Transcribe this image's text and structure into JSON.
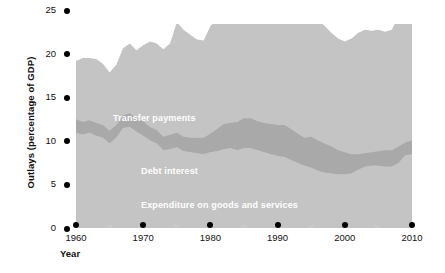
{
  "chart_data": {
    "type": "area",
    "title": "",
    "xlabel": "Year",
    "ylabel": "Outlays (percentage of GDP)",
    "xlim": [
      1960,
      2010
    ],
    "ylim": [
      0,
      25
    ],
    "grid": false,
    "legend_position": "in-plot",
    "stacked": true,
    "x": [
      1960,
      1961,
      1962,
      1963,
      1964,
      1965,
      1966,
      1967,
      1968,
      1969,
      1970,
      1971,
      1972,
      1973,
      1974,
      1975,
      1976,
      1977,
      1978,
      1979,
      1980,
      1981,
      1982,
      1983,
      1984,
      1985,
      1986,
      1987,
      1988,
      1989,
      1990,
      1991,
      1992,
      1993,
      1994,
      1995,
      1996,
      1997,
      1998,
      1999,
      2000,
      2001,
      2002,
      2003,
      2004,
      2005,
      2006,
      2007,
      2008,
      2009,
      2010
    ],
    "series": [
      {
        "name": "Expenditure on goods and services",
        "color": "#c4c4c4",
        "values": [
          9.8,
          9.6,
          9.8,
          9.5,
          9.3,
          8.7,
          9.3,
          10.3,
          10.4,
          9.9,
          9.5,
          9.0,
          8.7,
          8.0,
          8.1,
          8.3,
          7.9,
          7.8,
          7.7,
          7.6,
          7.8,
          7.9,
          8.1,
          8.2,
          8.0,
          8.2,
          8.2,
          8.0,
          7.8,
          7.6,
          7.4,
          7.3,
          7.0,
          6.7,
          6.4,
          6.2,
          5.9,
          5.7,
          5.6,
          5.5,
          5.5,
          5.6,
          6.0,
          6.3,
          6.4,
          6.4,
          6.3,
          6.3,
          6.7,
          7.5,
          7.6
        ]
      },
      {
        "name": "Debt interest",
        "color": "#a9a9a9",
        "values": [
          1.4,
          1.3,
          1.3,
          1.3,
          1.3,
          1.3,
          1.3,
          1.3,
          1.4,
          1.4,
          1.5,
          1.4,
          1.4,
          1.4,
          1.5,
          1.5,
          1.5,
          1.5,
          1.6,
          1.7,
          1.9,
          2.3,
          2.6,
          2.6,
          2.9,
          3.1,
          3.1,
          3.0,
          3.0,
          3.1,
          3.2,
          3.3,
          3.2,
          3.0,
          2.9,
          3.2,
          3.1,
          3.0,
          2.8,
          2.5,
          2.3,
          2.0,
          1.6,
          1.4,
          1.4,
          1.5,
          1.7,
          1.7,
          1.7,
          1.3,
          1.4
        ]
      },
      {
        "name": "Transfer payments",
        "color": "#c4c4c4",
        "values": [
          6.0,
          6.6,
          6.4,
          6.6,
          6.3,
          6.0,
          6.2,
          6.9,
          7.2,
          7.0,
          7.8,
          8.8,
          8.9,
          9.0,
          9.4,
          11.4,
          11.0,
          10.6,
          10.1,
          10.0,
          11.1,
          11.3,
          11.9,
          12.2,
          11.3,
          11.4,
          11.4,
          11.1,
          10.9,
          10.9,
          11.4,
          12.4,
          13.0,
          12.9,
          12.6,
          12.8,
          12.5,
          12.1,
          11.7,
          11.5,
          11.4,
          11.9,
          12.5,
          12.7,
          12.5,
          12.5,
          12.2,
          12.4,
          13.5,
          15.6,
          15.4
        ]
      }
    ],
    "yticks": [
      0,
      5,
      10,
      15,
      20,
      25
    ],
    "xticks": [
      1960,
      1970,
      1980,
      1990,
      2000,
      2010
    ],
    "xticks_minor": [
      1965,
      1975,
      1985,
      1995,
      2005
    ]
  },
  "axes": {
    "y_title": "Outlays (percentage of GDP)",
    "x_title": "Year",
    "y_tick_labels": [
      "25",
      "20",
      "15",
      "10",
      "5",
      "0"
    ],
    "x_tick_labels": [
      "1960",
      "1970",
      "1980",
      "1990",
      "2000",
      "2010"
    ]
  },
  "labels": {
    "transfer_payments": "Transfer payments",
    "debt_interest": "Debt interest",
    "expenditure": "Expenditure on goods and services"
  },
  "colors": {
    "band_outer": "#c4c4c4",
    "band_middle": "#a9a9a9",
    "tick_dot": "#000000",
    "tick_minor": "#c9c9c9",
    "text": "#111111",
    "label_text": "#ffffff",
    "background": "#ffffff"
  }
}
